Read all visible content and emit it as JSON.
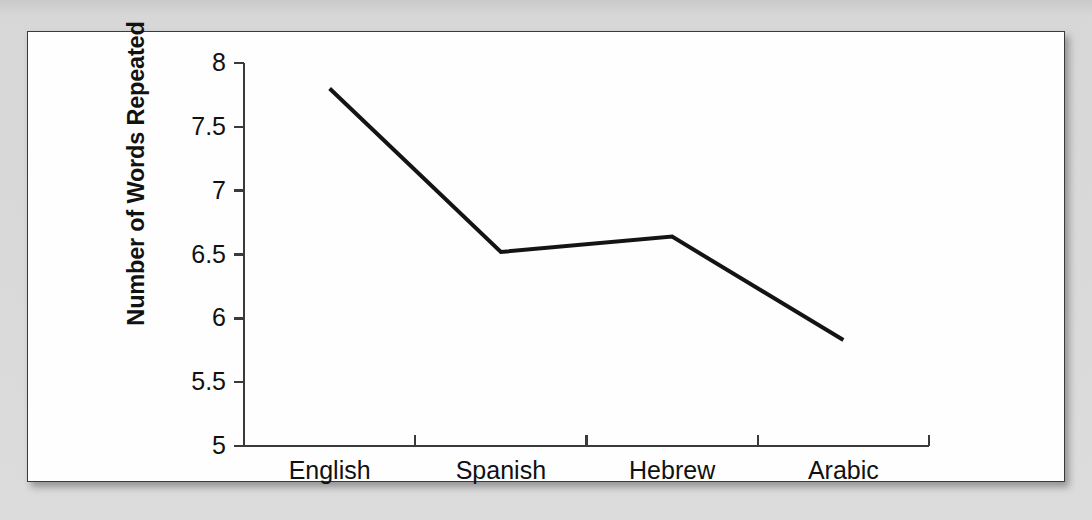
{
  "figure": {
    "background_page_color": "#d9d9d9",
    "panel_color": "#fefefe",
    "border_color": "#3a3a3a",
    "line_color": "#141414",
    "showthrough_text": "the rates at which words were repeated across the four language groups in the study. Participants heard spoken word lists and were asked to recall as many items as possible. Repetition counts were recorded for each trial and averaged across all sessions. The results suggest that phonological structure of the language may influence the number of words that listeners repeat. English speakers repeated the greatest number of words overall, while Arabic speakers repeated the fewest. Spanish and Hebrew fell between these two extremes and did not differ reliably from one another in the present sample of responses. Further analysis of these patterns is reported in the following section of this chapter."
  },
  "chart_data": {
    "type": "line",
    "title": "",
    "xlabel": "",
    "ylabel": "Number of Words Repeated",
    "categories": [
      "English",
      "Spanish",
      "Hebrew",
      "Arabic"
    ],
    "values": [
      7.8,
      6.52,
      6.64,
      5.83
    ],
    "series": [
      {
        "name": "Number of Words Repeated",
        "values": [
          7.8,
          6.52,
          6.64,
          5.83
        ]
      }
    ],
    "ylim": [
      5,
      8
    ],
    "yticks": [
      5,
      5.5,
      6,
      6.5,
      7,
      7.5,
      8
    ],
    "ytick_labels": [
      "5",
      "5.5",
      "6",
      "6.5",
      "7",
      "7.5",
      "8"
    ],
    "grid": false,
    "legend": false,
    "markers": false,
    "line_width": 4
  }
}
